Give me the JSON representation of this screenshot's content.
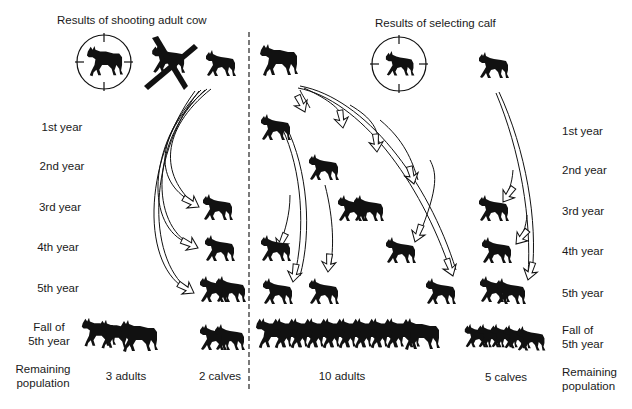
{
  "titles": {
    "left": "Results of shooting adult cow",
    "right": "Results of selecting calf"
  },
  "row_labels": {
    "y1": "1st year",
    "y2": "2nd year",
    "y3": "3rd year",
    "y4": "4th year",
    "y5": "5th year",
    "fall": "Fall of\n5th year",
    "remaining": "Remaining\npopulation"
  },
  "results": {
    "left_adults": "3 adults",
    "left_calves": "2 calves",
    "right_adults": "10 adults",
    "right_calves": "5 calves"
  },
  "icons": {
    "adult_moose": "moose-adult-silhouette",
    "calf_moose": "moose-calf-silhouette",
    "crosshair": "rifle-scope-crosshair",
    "cross_out": "x-cross-mark",
    "arrow": "hollow-curved-arrow",
    "divider": "dashed-vertical-divider"
  },
  "colors": {
    "ink": "#111111",
    "background": "#ffffff"
  }
}
